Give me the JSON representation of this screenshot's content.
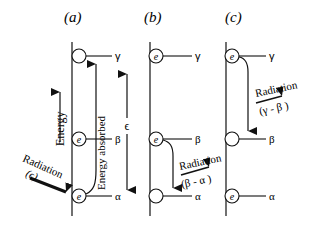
{
  "panels": [
    {
      "label": "(a)",
      "levels": [
        {
          "symbol": "γ",
          "electron": false
        },
        {
          "symbol": "β",
          "electron": true
        },
        {
          "symbol": "α",
          "electron": true
        }
      ],
      "annotations": {
        "energy_axis": "Energy",
        "energy_absorbed": "Energy absorbed",
        "epsilon": "ϵ",
        "radiation": "Radiation",
        "radiation_value": "(ϵ)"
      }
    },
    {
      "label": "(b)",
      "levels": [
        {
          "symbol": "γ",
          "electron": true
        },
        {
          "symbol": "β",
          "electron": true
        },
        {
          "symbol": "α",
          "electron": false
        }
      ],
      "annotations": {
        "radiation": "Radiation",
        "radiation_value": "(β - α )"
      }
    },
    {
      "label": "(c)",
      "levels": [
        {
          "symbol": "γ",
          "electron": true
        },
        {
          "symbol": "β",
          "electron": false
        },
        {
          "symbol": "α",
          "electron": true
        }
      ],
      "annotations": {
        "radiation": "Radiation",
        "radiation_value": "(γ - β )"
      }
    }
  ],
  "electron_symbol": "e",
  "colors": {
    "line": "#111111",
    "background": "#ffffff"
  }
}
